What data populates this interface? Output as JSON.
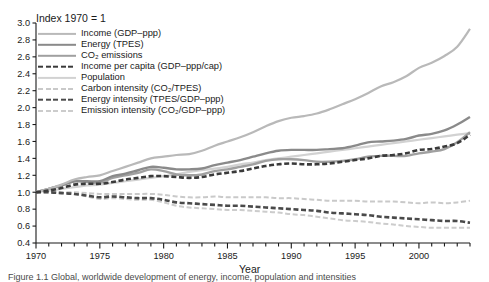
{
  "figure": {
    "title": "Index 1970 = 1",
    "axis_x_title": "Year",
    "caption": "Figure 1.1 Global, worldwide development of energy, income, population and intensities"
  },
  "legend": {
    "entries": [
      {
        "label": "Income (GDP–ppp)",
        "color": "#b9b9b9",
        "style": "solid",
        "width": 2.2
      },
      {
        "label": "Energy (TPES)",
        "color": "#8a8a8a",
        "style": "solid",
        "width": 2.4
      },
      {
        "label": "CO₂ emissions",
        "color": "#a0a0a0",
        "style": "solid",
        "width": 2.4
      },
      {
        "label": "Income per capita (GDP–ppp/cap)",
        "color": "#3a3a3a",
        "style": "dashed",
        "width": 2.6
      },
      {
        "label": "Population",
        "color": "#d2d2d2",
        "style": "solid",
        "width": 2.2
      },
      {
        "label": "Carbon intensity (CO₂/TPES)",
        "color": "#c9c9c9",
        "style": "dashed",
        "width": 2.0
      },
      {
        "label": "Energy intensity (TPES/GDP–ppp)",
        "color": "#4a4a4a",
        "style": "dashed",
        "width": 2.6
      },
      {
        "label": "Emission intensity (CO₂/GDP–ppp)",
        "color": "#cccccc",
        "style": "dashed",
        "width": 2.0
      }
    ]
  },
  "chart_data": {
    "type": "line",
    "title": "Index 1970 = 1",
    "xlabel": "Year",
    "ylabel": "",
    "xlim": [
      1970,
      2004
    ],
    "ylim": [
      0.4,
      3.0
    ],
    "ytick_step": 0.2,
    "yticks": [
      0.4,
      0.6,
      0.8,
      1.0,
      1.2,
      1.4,
      1.6,
      1.8,
      2.0,
      2.2,
      2.4,
      2.6,
      2.8,
      3.0
    ],
    "xticks_labeled": [
      1970,
      1975,
      1980,
      1985,
      1990,
      1995,
      2000
    ],
    "xticks_minor_step": 1,
    "grid": false,
    "legend_position": "upper-left-inside",
    "x": [
      1970,
      1971,
      1972,
      1973,
      1974,
      1975,
      1976,
      1977,
      1978,
      1979,
      1980,
      1981,
      1982,
      1983,
      1984,
      1985,
      1986,
      1987,
      1988,
      1989,
      1990,
      1991,
      1992,
      1993,
      1994,
      1995,
      1996,
      1997,
      1998,
      1999,
      2000,
      2001,
      2002,
      2003,
      2004
    ],
    "series": [
      {
        "name": "Income (GDP-ppp)",
        "color": "#b9b9b9",
        "style": "solid",
        "values": [
          1.0,
          1.04,
          1.09,
          1.15,
          1.18,
          1.2,
          1.25,
          1.3,
          1.35,
          1.4,
          1.42,
          1.44,
          1.45,
          1.49,
          1.55,
          1.6,
          1.65,
          1.71,
          1.78,
          1.84,
          1.88,
          1.9,
          1.93,
          1.98,
          2.04,
          2.1,
          2.17,
          2.25,
          2.3,
          2.37,
          2.47,
          2.53,
          2.61,
          2.72,
          2.93
        ]
      },
      {
        "name": "Energy (TPES)",
        "color": "#8a8a8a",
        "style": "solid",
        "values": [
          1.0,
          1.04,
          1.08,
          1.13,
          1.13,
          1.13,
          1.19,
          1.22,
          1.26,
          1.3,
          1.29,
          1.27,
          1.27,
          1.28,
          1.32,
          1.35,
          1.38,
          1.42,
          1.46,
          1.49,
          1.5,
          1.5,
          1.5,
          1.51,
          1.52,
          1.55,
          1.59,
          1.6,
          1.61,
          1.63,
          1.67,
          1.69,
          1.73,
          1.8,
          1.89
        ]
      },
      {
        "name": "CO2 emissions",
        "color": "#a0a0a0",
        "style": "solid",
        "values": [
          1.0,
          1.04,
          1.08,
          1.13,
          1.12,
          1.11,
          1.17,
          1.2,
          1.23,
          1.27,
          1.25,
          1.21,
          1.2,
          1.21,
          1.25,
          1.27,
          1.3,
          1.33,
          1.37,
          1.39,
          1.39,
          1.38,
          1.36,
          1.36,
          1.37,
          1.39,
          1.42,
          1.43,
          1.43,
          1.43,
          1.46,
          1.48,
          1.51,
          1.59,
          1.71
        ]
      },
      {
        "name": "Income per capita (GDP-ppp/cap)",
        "color": "#3a3a3a",
        "style": "dashed",
        "values": [
          1.0,
          1.02,
          1.05,
          1.09,
          1.1,
          1.1,
          1.12,
          1.15,
          1.17,
          1.19,
          1.19,
          1.18,
          1.17,
          1.18,
          1.21,
          1.23,
          1.25,
          1.28,
          1.31,
          1.33,
          1.34,
          1.33,
          1.33,
          1.34,
          1.36,
          1.38,
          1.4,
          1.43,
          1.44,
          1.46,
          1.5,
          1.51,
          1.54,
          1.58,
          1.68
        ]
      },
      {
        "name": "Population",
        "color": "#d2d2d2",
        "style": "solid",
        "values": [
          1.0,
          1.02,
          1.04,
          1.06,
          1.08,
          1.09,
          1.11,
          1.13,
          1.15,
          1.17,
          1.19,
          1.21,
          1.24,
          1.26,
          1.28,
          1.3,
          1.33,
          1.35,
          1.38,
          1.4,
          1.42,
          1.44,
          1.46,
          1.48,
          1.5,
          1.52,
          1.54,
          1.56,
          1.58,
          1.6,
          1.62,
          1.64,
          1.66,
          1.68,
          1.7
        ]
      },
      {
        "name": "Carbon intensity (CO2/TPES)",
        "color": "#c9c9c9",
        "style": "dashed",
        "values": [
          1.0,
          1.0,
          1.0,
          1.0,
          0.99,
          0.98,
          0.98,
          0.98,
          0.98,
          0.98,
          0.97,
          0.95,
          0.94,
          0.94,
          0.95,
          0.94,
          0.94,
          0.94,
          0.94,
          0.93,
          0.93,
          0.92,
          0.91,
          0.9,
          0.9,
          0.9,
          0.89,
          0.89,
          0.89,
          0.88,
          0.87,
          0.88,
          0.87,
          0.88,
          0.9
        ]
      },
      {
        "name": "Energy intensity (TPES/GDP-ppp)",
        "color": "#4a4a4a",
        "style": "dashed",
        "values": [
          1.0,
          1.0,
          0.99,
          0.98,
          0.96,
          0.94,
          0.95,
          0.94,
          0.93,
          0.93,
          0.91,
          0.88,
          0.87,
          0.86,
          0.85,
          0.84,
          0.84,
          0.83,
          0.82,
          0.81,
          0.8,
          0.79,
          0.78,
          0.76,
          0.75,
          0.74,
          0.73,
          0.71,
          0.7,
          0.69,
          0.68,
          0.67,
          0.66,
          0.66,
          0.64
        ]
      },
      {
        "name": "Emission intensity (CO2/GDP-ppp)",
        "color": "#cccccc",
        "style": "dashed",
        "values": [
          1.0,
          1.0,
          0.99,
          0.98,
          0.95,
          0.92,
          0.93,
          0.92,
          0.91,
          0.91,
          0.88,
          0.84,
          0.82,
          0.81,
          0.8,
          0.79,
          0.79,
          0.78,
          0.77,
          0.76,
          0.74,
          0.73,
          0.71,
          0.69,
          0.67,
          0.66,
          0.65,
          0.63,
          0.62,
          0.6,
          0.59,
          0.58,
          0.58,
          0.58,
          0.58
        ]
      }
    ]
  }
}
